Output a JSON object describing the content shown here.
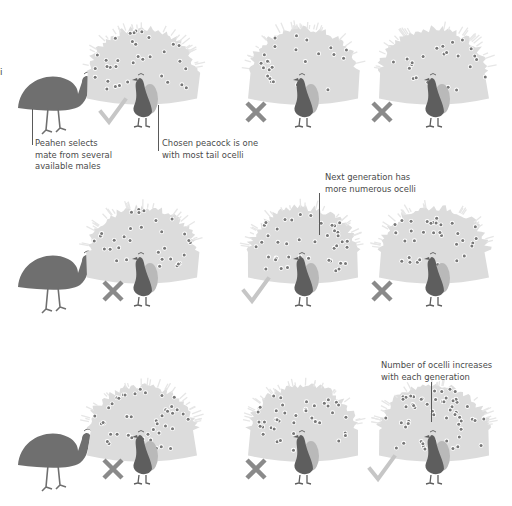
{
  "figure": {
    "colors": {
      "peahen": "#6f6f6f",
      "peacock_body": "#5e5e5e",
      "tail_fan": "#dcdcdc",
      "wing": "#b9b9b9",
      "ocellus": "#777777",
      "check_mark": "#c6c6c6",
      "cross_mark": "#8a8a8a",
      "leader_line": "#5a5a5a",
      "text": "#4a4a4a"
    },
    "edge_fragment": "i",
    "rows": [
      {
        "id": "generation-1",
        "males": [
          {
            "mark": "check",
            "ocelli_level": "medium"
          },
          {
            "mark": "cross",
            "ocelli_level": "low"
          },
          {
            "mark": "cross",
            "ocelli_level": "low"
          }
        ]
      },
      {
        "id": "generation-2",
        "males": [
          {
            "mark": "cross",
            "ocelli_level": "medium"
          },
          {
            "mark": "check",
            "ocelli_level": "high"
          },
          {
            "mark": "cross",
            "ocelli_level": "medium"
          }
        ]
      },
      {
        "id": "generation-3",
        "males": [
          {
            "mark": "cross",
            "ocelli_level": "high"
          },
          {
            "mark": "cross",
            "ocelli_level": "high"
          },
          {
            "mark": "check",
            "ocelli_level": "very-high"
          }
        ]
      }
    ],
    "annotations": {
      "peahen": [
        "Peahen selects",
        "mate from several",
        "available males"
      ],
      "chosen": [
        "Chosen peacock is one",
        "with most tail ocelli"
      ],
      "next_gen": [
        "Next generation has",
        "more numerous ocelli"
      ],
      "increase": [
        "Number of ocelli increases",
        "with each generation"
      ]
    }
  }
}
